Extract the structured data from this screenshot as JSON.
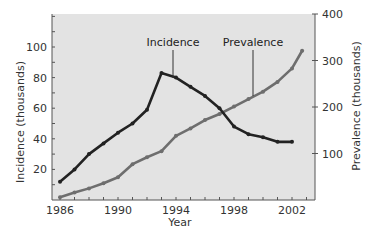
{
  "chart_data": {
    "type": "line",
    "title": "",
    "xlabel": "Year",
    "ylabel": "Incidence (thousands)",
    "ylabel_right": "Prevalence (thousands)",
    "xlim": [
      1986,
      2003
    ],
    "ylim": [
      0,
      130
    ],
    "ylim_right": [
      0,
      400
    ],
    "x_ticks": [
      1986,
      1990,
      1994,
      1998,
      2002
    ],
    "x_minor_tick_step": 1,
    "y_ticks": [
      20,
      40,
      60,
      80,
      100
    ],
    "y_ticks_right": [
      100,
      200,
      300,
      400
    ],
    "grid": false,
    "legend": "none (direct annotations with leader lines)",
    "annotations": [
      {
        "text": "Incidence",
        "points_to_series": "Incidence"
      },
      {
        "text": "Prevalence",
        "points_to_series": "Prevalence"
      }
    ],
    "series": [
      {
        "name": "Incidence",
        "axis": "left",
        "color": "#222222",
        "x": [
          1986,
          1987,
          1988,
          1989,
          1990,
          1991,
          1992,
          1993,
          1994,
          1995,
          1996,
          1997,
          1998,
          1999,
          2000,
          2001,
          2002
        ],
        "values": [
          12,
          20,
          30,
          37,
          44,
          50,
          59,
          83,
          80,
          74,
          68,
          60,
          48,
          43,
          41,
          38,
          38
        ]
      },
      {
        "name": "Prevalence",
        "axis": "right",
        "color": "#6e6e6e",
        "x": [
          1986,
          1987,
          1988,
          1989,
          1990,
          1991,
          1992,
          1993,
          1994,
          1995,
          1996,
          1997,
          1998,
          1999,
          2000,
          2001,
          2002,
          2002.7
        ],
        "values": [
          6,
          16,
          25,
          36,
          49,
          77,
          92,
          105,
          138,
          154,
          172,
          185,
          201,
          217,
          233,
          254,
          283,
          321
        ]
      }
    ]
  },
  "colors": {
    "plot_background": "#e3e3e3",
    "axis": "#555555",
    "incidence_line": "#222222",
    "prevalence_line": "#6e6e6e"
  }
}
